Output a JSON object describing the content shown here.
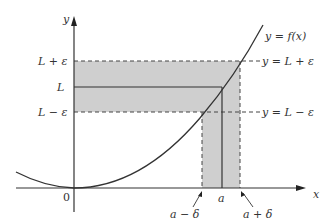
{
  "diagram": {
    "axes": {
      "x_label": "x",
      "y_label": "y",
      "origin_label": "0"
    },
    "y_labels": {
      "upper": "L + ε",
      "middle": "L",
      "lower": "L − ε"
    },
    "x_labels": {
      "left": "a − δ",
      "center": "a",
      "right": "a + δ"
    },
    "line_labels": {
      "curve": "y = f(x)",
      "upper": "y = L + ε",
      "lower": "y = L − ε"
    },
    "colors": {
      "band": "#c8c8c8",
      "line": "#333333"
    }
  }
}
